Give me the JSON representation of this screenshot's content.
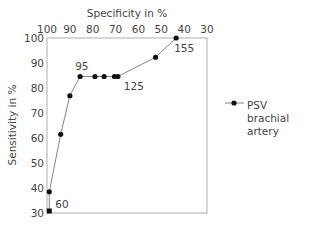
{
  "chart_data": {
    "type": "line",
    "title": "",
    "xlabel": "Specificity in %",
    "ylabel": "Sensitivity in %",
    "x_axis_position": "top",
    "x_reversed": true,
    "xlim": [
      100,
      30
    ],
    "ylim": [
      30,
      100
    ],
    "x_ticks": [
      100,
      90,
      80,
      70,
      60,
      50,
      40,
      30
    ],
    "y_ticks": [
      30,
      40,
      50,
      60,
      70,
      80,
      90,
      100
    ],
    "grid": false,
    "legend_position": "right",
    "series": [
      {
        "name": "PSV brachial artery",
        "marker": "circle",
        "color": "#111111",
        "line_color": "#777777",
        "points": [
          {
            "specificity": 99,
            "sensitivity": 30.8
          },
          {
            "specificity": 99,
            "sensitivity": 38.5
          },
          {
            "specificity": 94,
            "sensitivity": 61.5
          },
          {
            "specificity": 90,
            "sensitivity": 76.9
          },
          {
            "specificity": 85.5,
            "sensitivity": 84.6
          },
          {
            "specificity": 79,
            "sensitivity": 84.6
          },
          {
            "specificity": 75,
            "sensitivity": 84.6
          },
          {
            "specificity": 70.5,
            "sensitivity": 84.6
          },
          {
            "specificity": 69,
            "sensitivity": 84.6
          },
          {
            "specificity": 52.5,
            "sensitivity": 92.3
          },
          {
            "specificity": 43.5,
            "sensitivity": 100
          }
        ]
      }
    ],
    "annotations": [
      {
        "text": "60",
        "specificity": 99,
        "sensitivity": 30.8
      },
      {
        "text": "95",
        "specificity": 85.5,
        "sensitivity": 84.6
      },
      {
        "text": "125",
        "specificity": 69,
        "sensitivity": 84.6
      },
      {
        "text": "155",
        "specificity": 43.5,
        "sensitivity": 100
      }
    ]
  },
  "legend": {
    "label_line1": "PSV brachial",
    "label_line2": "artery"
  }
}
